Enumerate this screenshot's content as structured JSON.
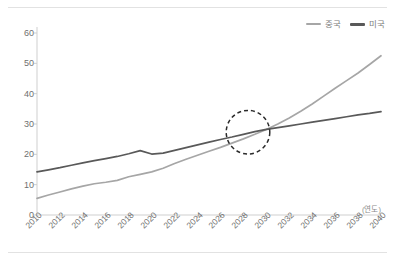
{
  "chart_data": {
    "type": "line",
    "title": "",
    "subtitle": "",
    "xlabel": "(연도)",
    "ylabel": "",
    "xlim": [
      2010,
      2040
    ],
    "ylim": [
      0,
      60
    ],
    "grid": false,
    "legend_position": "top-right",
    "x": [
      2010,
      2011,
      2012,
      2013,
      2014,
      2015,
      2016,
      2017,
      2018,
      2019,
      2020,
      2021,
      2022,
      2023,
      2024,
      2025,
      2026,
      2027,
      2028,
      2029,
      2030,
      2031,
      2032,
      2033,
      2034,
      2035,
      2036,
      2037,
      2038,
      2039,
      2040
    ],
    "xticks": [
      "2010",
      "2012",
      "2014",
      "2016",
      "2018",
      "2020",
      "2022",
      "2024",
      "2026",
      "2028",
      "2030",
      "2032",
      "2034",
      "2036",
      "2038",
      "2040"
    ],
    "yticks": [
      "0",
      "10",
      "20",
      "30",
      "40",
      "50",
      "60"
    ],
    "series": [
      {
        "name": "중국",
        "color": "#a6a6a6",
        "values": [
          5.5,
          6.6,
          7.6,
          8.6,
          9.5,
          10.3,
          10.8,
          11.4,
          12.6,
          13.4,
          14.2,
          15.4,
          17.0,
          18.4,
          19.7,
          21.0,
          22.3,
          23.7,
          25.1,
          26.6,
          28.2,
          30.0,
          32.0,
          34.2,
          36.6,
          39.2,
          41.8,
          44.3,
          46.8,
          49.6,
          52.5
        ]
      },
      {
        "name": "미국",
        "color": "#595959",
        "values": [
          14.2,
          14.9,
          15.6,
          16.4,
          17.2,
          17.9,
          18.6,
          19.3,
          20.2,
          21.2,
          20.1,
          20.4,
          21.3,
          22.2,
          23.1,
          24.0,
          24.9,
          25.7,
          26.6,
          27.5,
          28.2,
          28.8,
          29.4,
          30.0,
          30.6,
          31.2,
          31.8,
          32.4,
          33.0,
          33.5,
          34.1
        ]
      }
    ],
    "annotations": [
      {
        "type": "dashed-circle",
        "label": "crossover-highlight",
        "x": 2028.4,
        "y": 27.3,
        "radius_years": 1.9,
        "color": "#2b2b2b"
      }
    ]
  }
}
